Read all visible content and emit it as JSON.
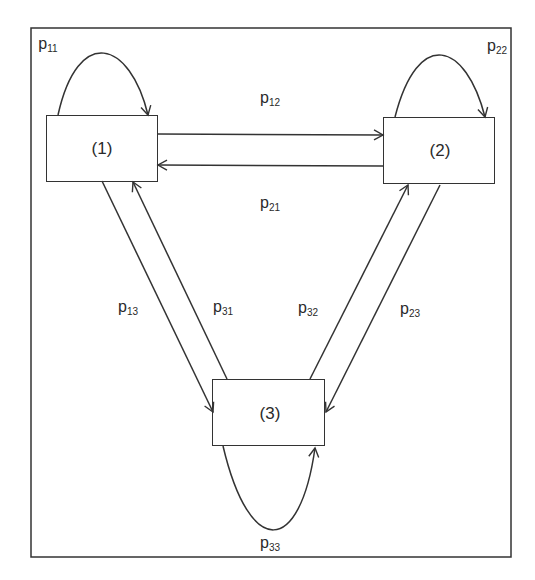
{
  "diagram": {
    "type": "markov-chain-state-transition",
    "states": [
      {
        "id": "1",
        "label": "(1)"
      },
      {
        "id": "2",
        "label": "(2)"
      },
      {
        "id": "3",
        "label": "(3)"
      }
    ],
    "transitions": [
      {
        "from": "1",
        "to": "1",
        "label_base": "p",
        "label_sub": "11"
      },
      {
        "from": "2",
        "to": "2",
        "label_base": "p",
        "label_sub": "22"
      },
      {
        "from": "3",
        "to": "3",
        "label_base": "p",
        "label_sub": "33"
      },
      {
        "from": "1",
        "to": "2",
        "label_base": "p",
        "label_sub": "12"
      },
      {
        "from": "2",
        "to": "1",
        "label_base": "p",
        "label_sub": "21"
      },
      {
        "from": "1",
        "to": "3",
        "label_base": "p",
        "label_sub": "13"
      },
      {
        "from": "3",
        "to": "1",
        "label_base": "p",
        "label_sub": "31"
      },
      {
        "from": "3",
        "to": "2",
        "label_base": "p",
        "label_sub": "32"
      },
      {
        "from": "2",
        "to": "3",
        "label_base": "p",
        "label_sub": "23"
      }
    ],
    "line_color": "#333333",
    "background": "#ffffff"
  }
}
